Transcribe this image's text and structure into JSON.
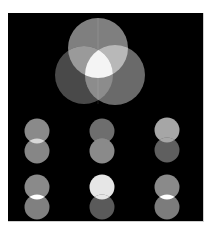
{
  "figure": {
    "background": "#000000",
    "page_background": "#ffffff"
  },
  "venn": {
    "circles": [
      {
        "name": "top",
        "cx": 98,
        "cy": 48,
        "r": 30,
        "color": "#7f7f7f"
      },
      {
        "name": "left",
        "cx": 84,
        "cy": 75,
        "r": 29,
        "color": "#4a4a4a"
      },
      {
        "name": "right",
        "cx": 115,
        "cy": 75,
        "r": 30,
        "color": "#6a6a6a"
      }
    ],
    "overlaps": {
      "top_left": "#9a9a9a",
      "top_right": "#b8b8b8",
      "left_right": "#8c8c8c",
      "all": "#f4f4f4"
    }
  },
  "pairs": [
    {
      "cx": 37,
      "top_cy": 131,
      "bottom_cy": 151,
      "r": 12.5,
      "top_color": "#8a8a8a",
      "bottom_color": "#868686",
      "overlap_color": "#d8d8d8"
    },
    {
      "cx": 102,
      "top_cy": 131,
      "bottom_cy": 151,
      "r": 12.5,
      "top_color": "#6e6e6e",
      "bottom_color": "#8a8a8a",
      "overlap_color": "#8a8a8a"
    },
    {
      "cx": 167,
      "top_cy": 130,
      "bottom_cy": 150,
      "r": 12.5,
      "top_color": "#a6a6a6",
      "bottom_color": "#5e5e5e",
      "overlap_color": "#a6a6a6"
    },
    {
      "cx": 37,
      "top_cy": 187,
      "bottom_cy": 207,
      "r": 12.5,
      "top_color": "#8a8a8a",
      "bottom_color": "#808080",
      "overlap_color": "#ffffff"
    },
    {
      "cx": 102,
      "top_cy": 187,
      "bottom_cy": 207,
      "r": 12.5,
      "top_color": "#e6e6e6",
      "bottom_color": "#5a5a5a",
      "overlap_color": "#e6e6e6"
    },
    {
      "cx": 167,
      "top_cy": 187,
      "bottom_cy": 207,
      "r": 12.5,
      "top_color": "#8a8a8a",
      "bottom_color": "#7c7c7c",
      "overlap_color": "#ffffff"
    }
  ]
}
